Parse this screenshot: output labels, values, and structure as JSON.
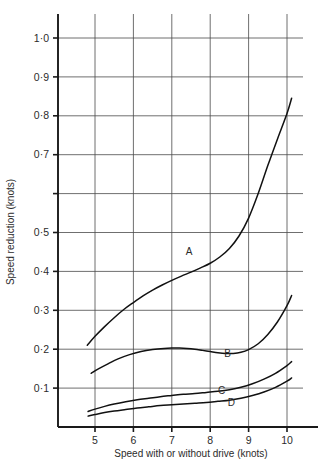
{
  "chart_data": {
    "type": "line",
    "title": "",
    "xlabel": "Speed with or without drive (knots)",
    "ylabel": "Speed reduction (knots)",
    "xlim": [
      4.6,
      10.35
    ],
    "ylim": [
      0,
      1.06
    ],
    "grid": true,
    "legend_position": "inline-curve-labels",
    "x_ticks": [
      5,
      6,
      7,
      8,
      9,
      10
    ],
    "x_tick_labels": [
      "5",
      "6",
      "7",
      "8",
      "9",
      "10"
    ],
    "y_ticks": [
      0.1,
      0.2,
      0.3,
      0.4,
      0.5,
      0.6,
      0.7,
      0.8,
      0.9,
      1.0
    ],
    "y_tick_labels": [
      "0·1",
      "0·2",
      "0·3",
      "0·4",
      "0·5",
      "",
      "0·7",
      "0·8",
      "0·9",
      "1·0"
    ],
    "series": [
      {
        "name": "A",
        "label": "A",
        "label_x": 7.45,
        "label_y": 0.45,
        "x": [
          4.8,
          5.0,
          5.25,
          5.5,
          5.75,
          6.0,
          6.25,
          6.5,
          6.75,
          7.0,
          7.25,
          7.5,
          7.75,
          8.0,
          8.25,
          8.5,
          8.75,
          9.0,
          9.25,
          9.5,
          9.75,
          10.0,
          10.12
        ],
        "y": [
          0.21,
          0.233,
          0.258,
          0.281,
          0.302,
          0.32,
          0.337,
          0.352,
          0.365,
          0.377,
          0.388,
          0.398,
          0.409,
          0.421,
          0.437,
          0.459,
          0.491,
          0.537,
          0.6,
          0.672,
          0.74,
          0.806,
          0.845
        ]
      },
      {
        "name": "B",
        "label": "B",
        "label_x": 8.45,
        "label_y": 0.19,
        "x": [
          4.9,
          5.1,
          5.35,
          5.6,
          5.9,
          6.2,
          6.5,
          6.8,
          7.0,
          7.2,
          7.4,
          7.6,
          7.8,
          8.0,
          8.2,
          8.4,
          8.6,
          8.8,
          9.0,
          9.25,
          9.5,
          9.75,
          10.0,
          10.12
        ],
        "y": [
          0.138,
          0.15,
          0.163,
          0.175,
          0.186,
          0.194,
          0.199,
          0.202,
          0.203,
          0.203,
          0.202,
          0.2,
          0.197,
          0.194,
          0.191,
          0.189,
          0.189,
          0.192,
          0.199,
          0.214,
          0.238,
          0.27,
          0.312,
          0.338
        ]
      },
      {
        "name": "C",
        "label": "C",
        "label_x": 8.3,
        "label_y": 0.095,
        "x": [
          4.82,
          5.0,
          5.25,
          5.5,
          5.8,
          6.1,
          6.4,
          6.7,
          7.0,
          7.3,
          7.6,
          7.9,
          8.2,
          8.5,
          8.8,
          9.1,
          9.4,
          9.7,
          10.0,
          10.12
        ],
        "y": [
          0.04,
          0.046,
          0.053,
          0.059,
          0.065,
          0.07,
          0.074,
          0.078,
          0.081,
          0.084,
          0.086,
          0.089,
          0.092,
          0.096,
          0.102,
          0.111,
          0.123,
          0.138,
          0.158,
          0.168
        ]
      },
      {
        "name": "D",
        "label": "D",
        "label_x": 8.55,
        "label_y": 0.063,
        "x": [
          4.82,
          5.0,
          5.25,
          5.5,
          5.8,
          6.1,
          6.4,
          6.7,
          7.0,
          7.3,
          7.6,
          7.9,
          8.2,
          8.5,
          8.8,
          9.1,
          9.4,
          9.7,
          10.0,
          10.12
        ],
        "y": [
          0.028,
          0.032,
          0.037,
          0.041,
          0.045,
          0.049,
          0.052,
          0.055,
          0.057,
          0.059,
          0.061,
          0.063,
          0.066,
          0.069,
          0.074,
          0.081,
          0.09,
          0.102,
          0.118,
          0.126
        ]
      }
    ]
  },
  "colors": {
    "curve": "#111111",
    "grid": "#4a4a4a",
    "axis": "#1a1a1a",
    "text": "#2b2b2b",
    "background": "#ffffff"
  }
}
